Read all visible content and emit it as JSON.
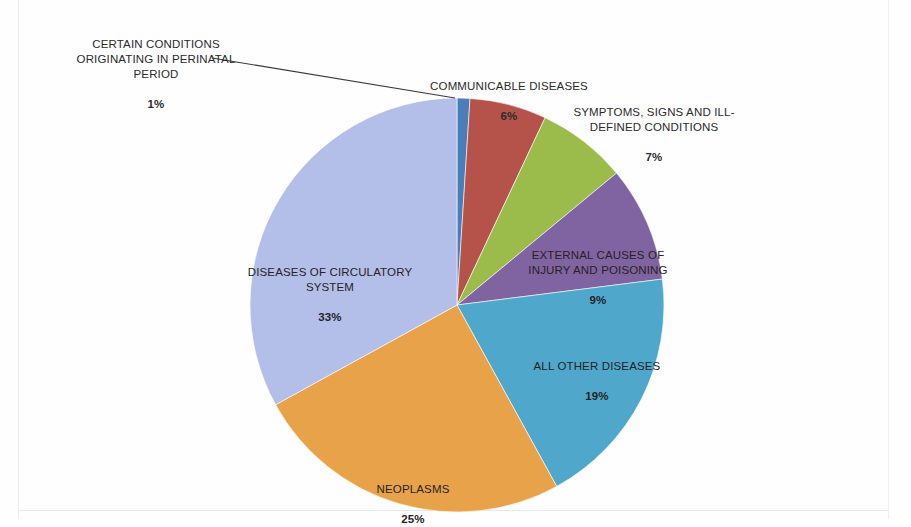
{
  "document": {
    "type": "scanned-pie-chart",
    "background_color": "#fefefe"
  },
  "chart_data": {
    "type": "pie",
    "title": "",
    "subtitle": "",
    "xlabel": "",
    "ylabel": "",
    "legend_position": "none",
    "grid": false,
    "labels_inside_slices": true,
    "start_angle_deg": 0,
    "direction": "clockwise",
    "categories": [
      "CERTAIN CONDITIONS ORIGINATING IN PERINATAL PERIOD",
      "COMMUNICABLE DISEASES",
      "SYMPTOMS, SIGNS AND ILL-DEFINED CONDITIONS",
      "EXTERNAL CAUSES OF INJURY AND POISONING",
      "ALL OTHER DISEASES",
      "NEOPLASMS",
      "DISEASES OF CIRCULATORY SYSTEM"
    ],
    "values": [
      1,
      6,
      7,
      9,
      19,
      25,
      33
    ],
    "value_labels": [
      "1%",
      "6%",
      "7%",
      "9%",
      "19%",
      "25%",
      "33%"
    ],
    "colors": [
      "#4A7EBB",
      "#B5534A",
      "#9BBB4B",
      "#8064A2",
      "#4FA8CC",
      "#E8A34A",
      "#B3BFE8"
    ],
    "units": "percent"
  },
  "slices": [
    {
      "key": "perinatal",
      "name": "CERTAIN CONDITIONS\nORIGINATING IN PERINATAL\nPERIOD",
      "percent": "1%",
      "color": "#4A7EBB",
      "label_placement": "outside-leader-line",
      "label_color": "#2b2b2b"
    },
    {
      "key": "communicable",
      "name": "COMMUNICABLE DISEASES",
      "percent": "6%",
      "color": "#B5534A",
      "label_placement": "outside",
      "label_color": "#2b2b2b"
    },
    {
      "key": "symptoms",
      "name": "SYMPTOMS, SIGNS AND ILL-\nDEFINED CONDITIONS",
      "percent": "7%",
      "color": "#9BBB4B",
      "label_placement": "outside",
      "label_color": "#2b2b2b"
    },
    {
      "key": "external",
      "name": "EXTERNAL CAUSES OF\nINJURY AND POISONING",
      "percent": "9%",
      "color": "#8064A2",
      "label_placement": "inside",
      "label_color": "#27221f"
    },
    {
      "key": "allother",
      "name": "ALL OTHER DISEASES",
      "percent": "19%",
      "color": "#4FA8CC",
      "label_placement": "inside",
      "label_color": "#27221f"
    },
    {
      "key": "neoplasms",
      "name": "NEOPLASMS",
      "percent": "25%",
      "color": "#E8A34A",
      "label_placement": "inside",
      "label_color": "#27221f"
    },
    {
      "key": "circulatory",
      "name": "DISEASES OF CIRCULATORY\nSYSTEM",
      "percent": "33%",
      "color": "#B3BFE8",
      "label_placement": "inside",
      "label_color": "#27221f"
    }
  ]
}
